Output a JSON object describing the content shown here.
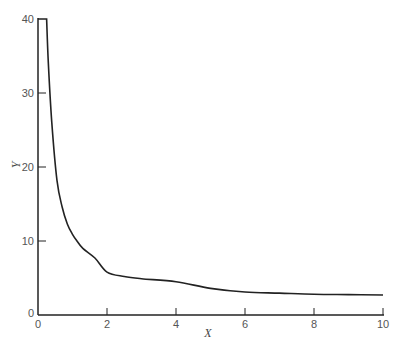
{
  "chart_data": {
    "type": "line",
    "title": "",
    "xlabel": "X",
    "ylabel": "Y",
    "xlim": [
      0,
      10
    ],
    "ylim": [
      0,
      40
    ],
    "x_ticks": [
      0,
      2,
      4,
      6,
      8,
      10
    ],
    "y_ticks": [
      0,
      10,
      20,
      30,
      40
    ],
    "grid": false,
    "legend": null,
    "series": [
      {
        "name": "Y vs X",
        "color": "#222222",
        "x": [
          0.0,
          0.25,
          0.3,
          0.4,
          0.55,
          0.7,
          0.85,
          1.0,
          1.13,
          1.3,
          1.65,
          2.0,
          2.5,
          3.0,
          4.0,
          5.0,
          6.0,
          7.0,
          8.0,
          9.0,
          10.0
        ],
        "y": [
          40.0,
          40.0,
          34.0,
          26.0,
          18.2,
          14.6,
          12.3,
          10.9,
          10.0,
          9.0,
          7.7,
          5.8,
          5.2,
          4.9,
          4.5,
          3.6,
          3.1,
          2.95,
          2.8,
          2.75,
          2.7
        ]
      }
    ],
    "annotations": [
      "curve clipped at Y=40 near X=0"
    ]
  },
  "labels": {
    "x_axis": "X",
    "y_axis": "Y"
  }
}
